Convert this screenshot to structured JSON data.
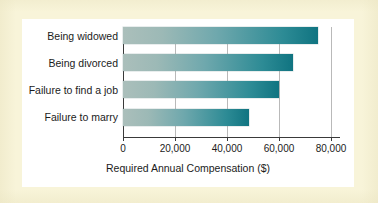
{
  "figure": {
    "background_color": "#f8f4d9",
    "panel_color": "#ffffff"
  },
  "chart_data": {
    "type": "bar",
    "orientation": "horizontal",
    "title": "",
    "subtitle": "",
    "xlabel": "Required Annual Compensation ($)",
    "ylabel": "",
    "categories": [
      "Being widowed",
      "Being divorced",
      "Failure to find a job",
      "Failure to marry"
    ],
    "values": [
      75000,
      65500,
      60000,
      48500
    ],
    "xlim": [
      0,
      80000
    ],
    "xticks": [
      0,
      20000,
      40000,
      60000,
      80000
    ],
    "xtick_labels": [
      "0",
      "20,000",
      "40,000",
      "60,000",
      "80,000"
    ],
    "grid": "vertical",
    "legend": "none",
    "bar_gradient_start": "#abbfbb",
    "bar_gradient_end": "#107481",
    "axis_color": "#3a3a3a",
    "gridline_color": "#b9b9b9"
  }
}
